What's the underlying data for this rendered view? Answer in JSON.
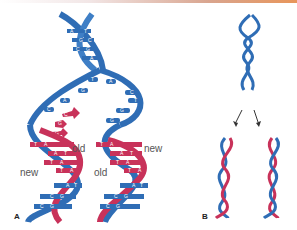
{
  "figure": {
    "panels": [
      {
        "id": "A",
        "label": "A"
      },
      {
        "id": "B",
        "label": "B"
      }
    ],
    "strand_labels": {
      "left_old": "old",
      "left_new": "new",
      "right_old": "old",
      "right_new": "new"
    },
    "colors": {
      "old_strand": "#2f6db5",
      "new_strand": "#c8325a",
      "label_text": "#555555"
    },
    "parent_base_pairs": [
      {
        "left": "A",
        "right": "T"
      },
      {
        "left": "G",
        "right": "C"
      },
      {
        "left": "C",
        "right": "G"
      },
      {
        "left": "A",
        "right": ""
      }
    ],
    "unpaired_bases_left": [
      "T",
      "G",
      "A",
      "C"
    ],
    "unpaired_bases_right": [
      "A",
      "C",
      "T",
      "G",
      "G",
      "G"
    ],
    "incoming_nucleotides": [
      "G",
      "C",
      "G"
    ],
    "left_daughter_pairs": [
      {
        "old": "T",
        "new": "A"
      },
      {
        "old": "A",
        "new": "T"
      },
      {
        "old": "T",
        "new": "A"
      },
      {
        "old": "T",
        "new": "A"
      },
      {
        "old": "A",
        "new": "T"
      },
      {
        "old": "C",
        "new": "G"
      },
      {
        "old": "C",
        "new": "G"
      }
    ],
    "right_daughter_pairs": [
      {
        "old": "T",
        "new": "A"
      },
      {
        "old": "A",
        "new": "T"
      },
      {
        "old": "T",
        "new": "A"
      },
      {
        "old": "T",
        "new": "A"
      },
      {
        "old": "A",
        "new": "T"
      },
      {
        "old": "C",
        "new": "G"
      },
      {
        "old": "C",
        "new": "G"
      }
    ]
  }
}
